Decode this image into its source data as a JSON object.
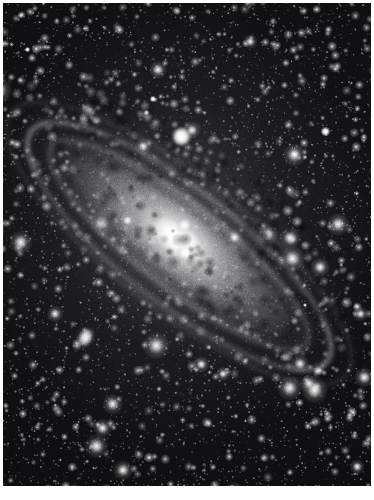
{
  "page": {
    "kind": "astronomical-photographic-plate",
    "width": 374,
    "height": 500,
    "background_color": "#ffffff",
    "rendering": "black-and-white halftone photographic print"
  },
  "plate": {
    "frame": {
      "x": 3,
      "y": 3,
      "width": 368,
      "height": 483
    },
    "sky_color": "#101012",
    "sky_note": "dense monochrome star field with photographic grain"
  },
  "subject": {
    "primary_label": "Andromeda Galaxy (M31)",
    "type": "spiral galaxy, high inclination",
    "major_axis_angle_deg": 38,
    "orientation_note": "major axis runs from upper-left to lower-right",
    "nucleus": {
      "x": 186,
      "y": 226,
      "brightness": "saturated white"
    },
    "features": [
      "bright saturated nuclear bulge",
      "multiple concentric dust lanes on the near (north-east) side",
      "broad outer spiral arms extending to lower-right",
      "resolved star clouds along the upper-left arm"
    ]
  },
  "objects": [
    {
      "id": "m31-nucleus",
      "label": "M31 nucleus",
      "x": 186,
      "y": 226,
      "kind": "galaxy-core"
    },
    {
      "id": "m32",
      "label": "M32 (NGC 221)",
      "x": 178,
      "y": 133,
      "kind": "companion-galaxy"
    },
    {
      "id": "m110",
      "label": "M110 (NGC 205)",
      "x": 82,
      "y": 334,
      "kind": "companion-galaxy"
    },
    {
      "id": "ngc206",
      "label": "NGC 206 star cloud",
      "x": 85,
      "y": 107,
      "kind": "star-cloud"
    },
    {
      "id": "star-ne",
      "label": "foreground star",
      "x": 322,
      "y": 128,
      "kind": "foreground-star"
    },
    {
      "id": "star-n",
      "label": "foreground star",
      "x": 150,
      "y": 96,
      "kind": "foreground-star"
    },
    {
      "id": "star-nw",
      "label": "foreground star",
      "x": 144,
      "y": 110,
      "kind": "foreground-star"
    }
  ],
  "colors": {
    "paper": "#ffffff",
    "sky": "#101012",
    "galaxy_light": "#e6e6e6",
    "dust": "#0c0c0e",
    "caption_text": "#d8d8d8"
  },
  "caption": {
    "text": ""
  }
}
